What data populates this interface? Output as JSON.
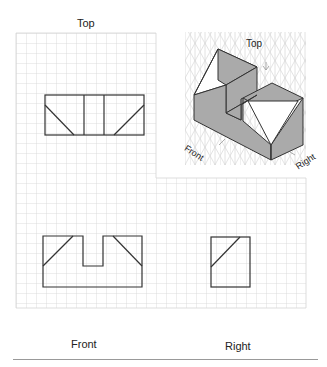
{
  "labels": {
    "top": "Top",
    "front": "Front",
    "right": "Right",
    "iso_top": "Top",
    "iso_front": "Front",
    "iso_right": "Right"
  },
  "colors": {
    "grid": "#d4d4d4",
    "line": "#333333",
    "iso_fill": "#aaaaaa",
    "iso_grid": "#d0d0d0",
    "rule": "#999999"
  },
  "grid": {
    "x0": 16,
    "y0": 33,
    "cell": 10,
    "cols_top": 14,
    "cols_bottom": 30,
    "rows": 29
  }
}
